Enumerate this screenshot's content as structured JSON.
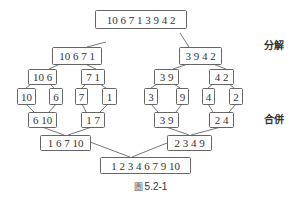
{
  "diagram": {
    "type": "merge-sort-tree",
    "labels": {
      "divide": "分解",
      "merge": "合併"
    },
    "caption": {
      "prefix": "圖",
      "number": "5.2-1"
    },
    "nodes": [
      {
        "id": "n0",
        "text": "10 6 7 1 3 9 4 2",
        "x": 95,
        "y": 10,
        "w": 91,
        "h": 18
      },
      {
        "id": "n1",
        "text": "10 6 7 1",
        "x": 52,
        "y": 47,
        "w": 49,
        "h": 17
      },
      {
        "id": "n2",
        "text": "3 9 4 2",
        "x": 179,
        "y": 47,
        "w": 42,
        "h": 17
      },
      {
        "id": "n3",
        "text": "10 6",
        "x": 28,
        "y": 69,
        "w": 28,
        "h": 15
      },
      {
        "id": "n4",
        "text": "7 1",
        "x": 81,
        "y": 69,
        "w": 23,
        "h": 15
      },
      {
        "id": "n5",
        "text": "3 9",
        "x": 154,
        "y": 69,
        "w": 24,
        "h": 15
      },
      {
        "id": "n6",
        "text": "4 2",
        "x": 209,
        "y": 69,
        "w": 24,
        "h": 15
      },
      {
        "id": "n7",
        "text": "10",
        "x": 17,
        "y": 88,
        "w": 18,
        "h": 16
      },
      {
        "id": "n8",
        "text": "6",
        "x": 49,
        "y": 88,
        "w": 13,
        "h": 16
      },
      {
        "id": "n9",
        "text": "7",
        "x": 75,
        "y": 88,
        "w": 12,
        "h": 16
      },
      {
        "id": "n10",
        "text": "1",
        "x": 102,
        "y": 88,
        "w": 14,
        "h": 16
      },
      {
        "id": "n11",
        "text": "3",
        "x": 144,
        "y": 88,
        "w": 13,
        "h": 16
      },
      {
        "id": "n12",
        "text": "9",
        "x": 176,
        "y": 88,
        "w": 12,
        "h": 16
      },
      {
        "id": "n13",
        "text": "4",
        "x": 202,
        "y": 88,
        "w": 12,
        "h": 16
      },
      {
        "id": "n14",
        "text": "2",
        "x": 229,
        "y": 88,
        "w": 13,
        "h": 16
      },
      {
        "id": "n15",
        "text": "6 10",
        "x": 28,
        "y": 112,
        "w": 28,
        "h": 15
      },
      {
        "id": "n16",
        "text": "1 7",
        "x": 81,
        "y": 112,
        "w": 23,
        "h": 15
      },
      {
        "id": "n17",
        "text": "3 9",
        "x": 154,
        "y": 112,
        "w": 24,
        "h": 15
      },
      {
        "id": "n18",
        "text": "2 4",
        "x": 209,
        "y": 112,
        "w": 24,
        "h": 15
      },
      {
        "id": "n19",
        "text": "1 6 7 10",
        "x": 40,
        "y": 135,
        "w": 50,
        "h": 15
      },
      {
        "id": "n20",
        "text": "2 3 4 9",
        "x": 167,
        "y": 135,
        "w": 44,
        "h": 15
      },
      {
        "id": "n21",
        "text": "1 2 3 4 6 7 9 10",
        "x": 100,
        "y": 157,
        "w": 90,
        "h": 16
      }
    ],
    "edges": [
      [
        106,
        42,
        87,
        47
      ],
      [
        180,
        33,
        189,
        47
      ],
      [
        60,
        64,
        49,
        69
      ],
      [
        85,
        64,
        96,
        69
      ],
      [
        188,
        64,
        173,
        69
      ],
      [
        213,
        64,
        226,
        69
      ],
      [
        31,
        84,
        26,
        88
      ],
      [
        50,
        84,
        54,
        88
      ],
      [
        86,
        84,
        82,
        88
      ],
      [
        100,
        84,
        106,
        88
      ],
      [
        157,
        84,
        151,
        88
      ],
      [
        174,
        84,
        180,
        88
      ],
      [
        213,
        84,
        208,
        88
      ],
      [
        229,
        84,
        234,
        88
      ],
      [
        26,
        104,
        34,
        112
      ],
      [
        56,
        104,
        49,
        112
      ],
      [
        82,
        104,
        86,
        112
      ],
      [
        108,
        104,
        100,
        112
      ],
      [
        151,
        104,
        158,
        112
      ],
      [
        182,
        104,
        176,
        112
      ],
      [
        208,
        104,
        213,
        112
      ],
      [
        236,
        104,
        229,
        112
      ],
      [
        42,
        127,
        64,
        135
      ],
      [
        92,
        127,
        68,
        135
      ],
      [
        166,
        127,
        189,
        135
      ],
      [
        221,
        127,
        191,
        135
      ],
      [
        90,
        142,
        130,
        157
      ],
      [
        167,
        143,
        132,
        157
      ]
    ]
  }
}
